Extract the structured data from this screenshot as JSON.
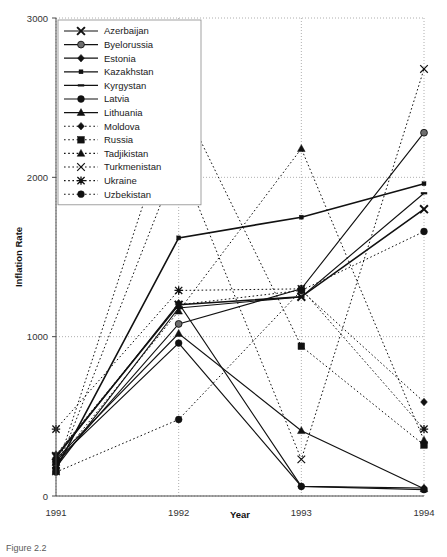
{
  "figure": {
    "caption": "Figure 2.2"
  },
  "chart_data": {
    "type": "line",
    "title": "",
    "xlabel": "Year",
    "ylabel": "Inflation Rate",
    "x": [
      1991,
      1992,
      1993,
      1994
    ],
    "xtick_labels": [
      "1991",
      "1992",
      "1993",
      "1994"
    ],
    "ytick_labels": [
      "0",
      "1000",
      "2000",
      "3000"
    ],
    "yticks": [
      0,
      1000,
      2000,
      3000
    ],
    "ylim": [
      0,
      3000
    ],
    "xlim": [
      1991,
      1994
    ],
    "grid": true,
    "legend_position": "top-left inside",
    "series": [
      {
        "name": "Azerbaijan",
        "marker": "x-bold",
        "linestyle": "solid",
        "values": [
          250,
          1200,
          1250,
          1800
        ]
      },
      {
        "name": "Byelorussia",
        "marker": "circle-hatch",
        "linestyle": "solid",
        "values": [
          200,
          1080,
          1300,
          2280
        ]
      },
      {
        "name": "Estonia",
        "marker": "diamond",
        "linestyle": "solid",
        "values": [
          240,
          1210,
          60,
          50
        ]
      },
      {
        "name": "Kazakhstan",
        "marker": "small-square",
        "linestyle": "solid",
        "values": [
          170,
          1620,
          1750,
          1960
        ]
      },
      {
        "name": "Kyrgystan",
        "marker": "small-dash",
        "linestyle": "solid",
        "values": [
          180,
          1180,
          1250,
          1900
        ]
      },
      {
        "name": "Latvia",
        "marker": "circle",
        "linestyle": "solid",
        "values": [
          220,
          960,
          60,
          40
        ]
      },
      {
        "name": "Lithuania",
        "marker": "triangle",
        "linestyle": "solid",
        "values": [
          230,
          1020,
          410,
          45
        ]
      },
      {
        "name": "Moldova",
        "marker": "diamond",
        "linestyle": "dotted",
        "values": [
          260,
          1200,
          1290,
          590
        ]
      },
      {
        "name": "Russia",
        "marker": "square",
        "linestyle": "dotted",
        "values": [
          160,
          2510,
          940,
          320
        ]
      },
      {
        "name": "Tadjikistan",
        "marker": "triangle",
        "linestyle": "dotted",
        "values": [
          210,
          1160,
          2180,
          350
        ]
      },
      {
        "name": "Turkmenistan",
        "marker": "x-thin",
        "linestyle": "dotted",
        "values": [
          155,
          2120,
          230,
          2680
        ]
      },
      {
        "name": "Ukraine",
        "marker": "asterisk",
        "linestyle": "dotted",
        "values": [
          420,
          1290,
          1300,
          420
        ]
      },
      {
        "name": "Uzbekistan",
        "marker": "circle",
        "linestyle": "dotted",
        "values": [
          150,
          480,
          1290,
          1660
        ]
      }
    ]
  }
}
